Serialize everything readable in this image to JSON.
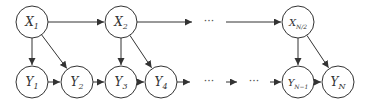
{
  "diagram": {
    "title": "",
    "colors": {
      "stroke": "#333333",
      "fill": "#ffffff",
      "text": "#333333"
    },
    "node_radius": 16,
    "nodes": [
      {
        "id": "X1",
        "base": "X",
        "sub": "1",
        "x": 32,
        "y": 22
      },
      {
        "id": "X2",
        "base": "X",
        "sub": "2",
        "x": 121,
        "y": 22
      },
      {
        "id": "XN2",
        "base": "X",
        "sub": "N/2",
        "x": 298,
        "y": 22
      },
      {
        "id": "Y1",
        "base": "Y",
        "sub": "1",
        "x": 32,
        "y": 82
      },
      {
        "id": "Y2",
        "base": "Y",
        "sub": "2",
        "x": 77,
        "y": 82
      },
      {
        "id": "Y3",
        "base": "Y",
        "sub": "3",
        "x": 121,
        "y": 82
      },
      {
        "id": "Y4",
        "base": "Y",
        "sub": "4",
        "x": 161,
        "y": 82
      },
      {
        "id": "YN1",
        "base": "Y",
        "sub": "N−1",
        "x": 298,
        "y": 82
      },
      {
        "id": "YN",
        "base": "Y",
        "sub": "N",
        "x": 338,
        "y": 82
      }
    ],
    "edges": [
      {
        "from": "X1",
        "to": "X2"
      },
      {
        "from": "X1",
        "to": "Y1"
      },
      {
        "from": "X1",
        "to": "Y2"
      },
      {
        "from": "X2",
        "to": "Y3"
      },
      {
        "from": "X2",
        "to": "Y4"
      },
      {
        "from": "XN2",
        "to": "YN1"
      },
      {
        "from": "XN2",
        "to": "YN"
      },
      {
        "from": "Y1",
        "to": "Y2"
      },
      {
        "from": "Y2",
        "to": "Y3"
      },
      {
        "from": "Y3",
        "to": "Y4"
      },
      {
        "from": "YN1",
        "to": "YN"
      }
    ],
    "free_edges": [
      {
        "x1": 137,
        "y1": 22,
        "x2": 192,
        "y2": 22
      },
      {
        "x1": 226,
        "y1": 22,
        "x2": 281,
        "y2": 22
      },
      {
        "x1": 177,
        "y1": 82,
        "x2": 190,
        "y2": 82
      },
      {
        "x1": 226,
        "y1": 82,
        "x2": 237,
        "y2": 82
      },
      {
        "x1": 270,
        "y1": 82,
        "x2": 281,
        "y2": 82
      }
    ],
    "ellipses": [
      {
        "text": "···",
        "x": 209,
        "y": 22
      },
      {
        "text": "···",
        "x": 209,
        "y": 82
      },
      {
        "text": "···",
        "x": 254,
        "y": 82
      }
    ]
  }
}
